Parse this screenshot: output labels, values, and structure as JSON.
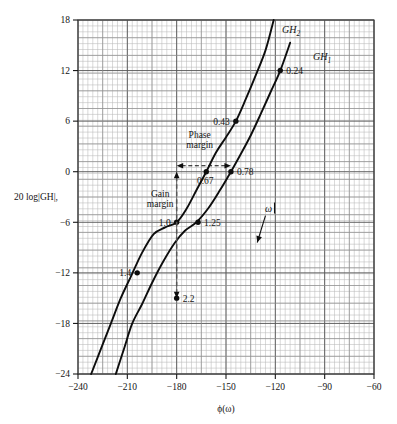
{
  "chart_data": {
    "type": "line",
    "title": "",
    "xlabel": "ϕ(ω)",
    "ylabel": "20 log|GH|,",
    "xlim": [
      -240,
      -60
    ],
    "ylim": [
      -24,
      18
    ],
    "xticks": [
      -240,
      -210,
      -180,
      -150,
      -120,
      -90,
      -60
    ],
    "xticklabels": [
      "−240",
      "−210",
      "−180",
      "−150",
      "−120",
      "−90",
      "−60"
    ],
    "yticks": [
      -24,
      -18,
      -12,
      -6,
      0,
      6,
      12,
      18
    ],
    "yticklabels": [
      "−24",
      "−18",
      "−12",
      "−6",
      "0",
      "6",
      "12",
      "18"
    ],
    "grid": true,
    "grid_minor_step_x": 3,
    "grid_minor_step_y": 0.7,
    "legend": "none",
    "series": [
      {
        "name": "GH2",
        "label": "GH",
        "label_sub": "2",
        "points": [
          [
            -232,
            -24
          ],
          [
            -226,
            -21
          ],
          [
            -220,
            -18
          ],
          [
            -214,
            -15
          ],
          [
            -208,
            -12.5
          ],
          [
            -201,
            -9.6
          ],
          [
            -194,
            -7.4
          ],
          [
            -187,
            -6.6
          ],
          [
            -180,
            -6.0
          ],
          [
            -174,
            -4.4
          ],
          [
            -168,
            -2.2
          ],
          [
            -162,
            0.0
          ],
          [
            -156,
            2.3
          ],
          [
            -150,
            4.1
          ],
          [
            -144,
            6.0
          ],
          [
            -138,
            8.6
          ],
          [
            -132,
            11.4
          ],
          [
            -126,
            14.4
          ],
          [
            -121,
            18.0
          ]
        ],
        "markers": [
          {
            "omega": "0.43",
            "x": -144,
            "y": 6.0,
            "label_side": "left"
          },
          {
            "omega": "0.67",
            "x": -162,
            "y": 0.0,
            "label_side": "below"
          },
          {
            "omega": "1.0",
            "x": -180,
            "y": -6.0,
            "label_side": "left"
          },
          {
            "omega": "1.4",
            "x": -204,
            "y": -12.0,
            "label_side": "left"
          }
        ]
      },
      {
        "name": "GH1",
        "label": "GH",
        "label_sub": "1",
        "points": [
          [
            -217,
            -24
          ],
          [
            -212,
            -21
          ],
          [
            -207,
            -18
          ],
          [
            -201,
            -15.7
          ],
          [
            -195,
            -13.2
          ],
          [
            -188,
            -10.6
          ],
          [
            -181,
            -8.4
          ],
          [
            -175,
            -7.0
          ],
          [
            -168,
            -6.0
          ],
          [
            -161,
            -4.4
          ],
          [
            -154,
            -2.3
          ],
          [
            -147,
            0.0
          ],
          [
            -141,
            2.1
          ],
          [
            -135,
            4.3
          ],
          [
            -129,
            6.8
          ],
          [
            -123,
            9.4
          ],
          [
            -117,
            12.0
          ],
          [
            -111,
            15.3
          ]
        ],
        "markers": [
          {
            "omega": "0.24",
            "x": -117,
            "y": 12.0,
            "label_side": "right"
          },
          {
            "omega": "0.78",
            "x": -147,
            "y": 0.0,
            "label_side": "right"
          },
          {
            "omega": "1.25",
            "x": -167,
            "y": -6.0,
            "label_side": "right"
          },
          {
            "omega": "2.2",
            "x": -180,
            "y": -15.0,
            "label_side": "right"
          }
        ]
      }
    ],
    "annotations": [
      {
        "name": "phase-margin",
        "text_line1": "Phase",
        "text_line2": "margin",
        "type": "double-arrow-horizontal",
        "y": 0.7,
        "x_from": -180,
        "x_to": -147,
        "text_x": -166,
        "text_y": 4.0
      },
      {
        "name": "gain-margin",
        "text_line1": "Gain",
        "text_line2": "margin",
        "type": "double-arrow-vertical",
        "x": -180,
        "y_from": 0.0,
        "y_to": -15.0,
        "text_x": -190,
        "text_y": -3.0
      },
      {
        "name": "omega-direction",
        "text": "ω",
        "type": "arrow",
        "x_tail": -126,
        "y_tail": -5.2,
        "x_head": -131,
        "y_head": -8.4
      }
    ]
  }
}
